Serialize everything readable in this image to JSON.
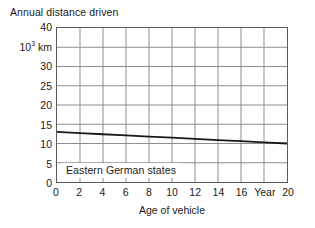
{
  "chart_data": {
    "type": "line",
    "title": "Annual distance driven",
    "ylabel": "Annual distance driven",
    "y_unit_label": "10<sup>3</sup> km",
    "y_unit_label_plain": "10^3 km",
    "xlabel": "Age of vehicle",
    "x_unit_label": "Year",
    "xlim": [
      0,
      20
    ],
    "ylim": [
      0,
      40
    ],
    "grid": true,
    "legend_position": "inside-bottom-left",
    "x_ticks": [
      0,
      2,
      4,
      6,
      8,
      10,
      12,
      14,
      16,
      18,
      20
    ],
    "x_tick_labels": [
      "0",
      "2",
      "4",
      "6",
      "8",
      "10",
      "12",
      "14",
      "16",
      "Year",
      "20"
    ],
    "y_ticks": [
      0,
      5,
      10,
      15,
      20,
      25,
      30,
      35,
      40
    ],
    "y_tick_labels": [
      "0",
      "5",
      "10",
      "15",
      "20",
      "25",
      "30",
      "35",
      "40"
    ],
    "y_tick_label_overrides": {
      "35": "10^3 km"
    },
    "series": [
      {
        "name": "Eastern German states",
        "color": "#1a1a1a",
        "x": [
          0,
          2,
          4,
          6,
          8,
          10,
          12,
          14,
          16,
          18,
          20
        ],
        "values": [
          13.0,
          12.7,
          12.4,
          12.1,
          11.8,
          11.5,
          11.2,
          10.9,
          10.6,
          10.3,
          10.0
        ]
      }
    ],
    "annotations": [
      {
        "text": "Eastern German states",
        "x": 0.3,
        "y": 2.6
      }
    ]
  },
  "axis": {
    "y_tick_40": "40",
    "y_tick_35": "10",
    "y_tick_35_sup": "3",
    "y_tick_35_unit": "km",
    "y_tick_30": "30",
    "y_tick_25": "25",
    "y_tick_20": "20",
    "y_tick_15": "15",
    "y_tick_10": "10",
    "y_tick_5": "5",
    "y_tick_0": "0",
    "x_tick_0": "0",
    "x_tick_2": "2",
    "x_tick_4": "4",
    "x_tick_6": "6",
    "x_tick_8": "8",
    "x_tick_10": "10",
    "x_tick_12": "12",
    "x_tick_14": "14",
    "x_tick_16": "16",
    "x_tick_18": "Year",
    "x_tick_20": "20"
  },
  "labels": {
    "y_axis_title": "Annual distance driven",
    "x_axis_title": "Age of vehicle",
    "series_annotation": "Eastern German states"
  },
  "colors": {
    "line": "#1a1a1a",
    "grid": "#8d8d8d",
    "frame": "#5a5a5a",
    "background": "#ffffff",
    "text": "#1a1a1a"
  }
}
